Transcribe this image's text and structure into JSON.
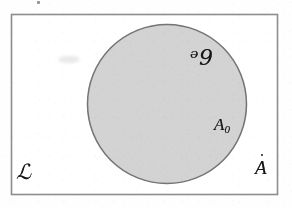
{
  "figure": {
    "kind": "set-diagram",
    "caption": "",
    "labels": {
      "outer_region": "ℒ",
      "outer_corner": "A",
      "outer_corner_accent": "dot-above",
      "disk_region": "ᵊ9",
      "disk_point_set": "A",
      "disk_point_set_subscript": "0"
    },
    "colors": {
      "page_background": "#fefefe",
      "frame_stroke": "#8d8d8d",
      "disk_fill": "#d4d4d4",
      "disk_stroke": "#6f6f6f",
      "ink": "#161616"
    },
    "geometry": {
      "frame": {
        "x": 11,
        "y": 14,
        "width": 267,
        "height": 181
      },
      "disk": {
        "cx": 167,
        "cy": 104,
        "r": 80
      }
    },
    "artifacts": {
      "smudge_note": "faint gray smudge",
      "speck_note": "small dark speck above frame"
    }
  }
}
